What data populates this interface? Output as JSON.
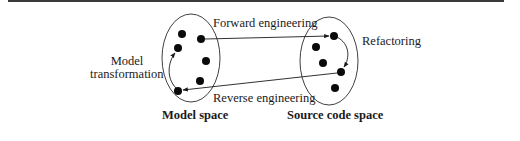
{
  "figure": {
    "labels": {
      "forward": "Forward engineering",
      "reverse": "Reverse engineering",
      "refactoring": "Refactoring",
      "model_transformation_line1": "Model",
      "model_transformation_line2": "transformation",
      "model_space": "Model space",
      "source_code_space": "Source code space"
    },
    "spaces": [
      {
        "name": "Model space",
        "points": 6
      },
      {
        "name": "Source code space",
        "points": 5
      }
    ],
    "arrows": [
      {
        "from": "Model space",
        "to": "Source code space",
        "label": "Forward engineering"
      },
      {
        "from": "Source code space",
        "to": "Model space",
        "label": "Reverse engineering"
      },
      {
        "from": "Model space",
        "to": "Model space",
        "label": "Model transformation"
      },
      {
        "from": "Source code space",
        "to": "Source code space",
        "label": "Refactoring"
      }
    ]
  }
}
